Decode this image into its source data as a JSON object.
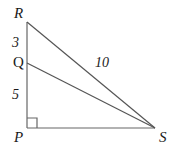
{
  "figure": {
    "background_color": "#ffffff",
    "stroke_color": "#555555",
    "text_color": "#1a1a1a",
    "vertices": {
      "R": {
        "label": "R",
        "x": 27,
        "y": 22
      },
      "Q": {
        "label": "Q",
        "x": 27,
        "y": 63
      },
      "P": {
        "label": "P",
        "x": 27,
        "y": 128
      },
      "S": {
        "label": "S",
        "x": 155,
        "y": 128
      }
    },
    "segments": [
      {
        "name": "segment-RP",
        "from": "R",
        "to": "P",
        "measure_label": null
      },
      {
        "name": "segment-PS",
        "from": "P",
        "to": "S",
        "measure_label": null
      },
      {
        "name": "segment-RS",
        "from": "R",
        "to": "S",
        "measure_label": "10"
      },
      {
        "name": "segment-QS",
        "from": "Q",
        "to": "S",
        "measure_label": null
      }
    ],
    "measures": {
      "RQ": "3",
      "QP": "5",
      "RS": "10"
    },
    "right_angle": {
      "at_vertex": "P",
      "marker": "square",
      "size": 10
    }
  }
}
